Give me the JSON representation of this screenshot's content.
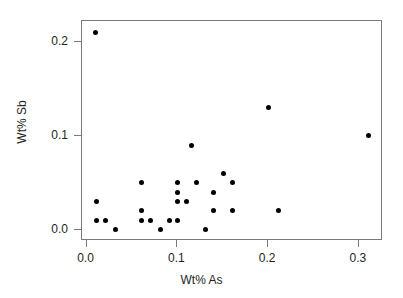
{
  "chart_data": {
    "type": "scatter",
    "title": "",
    "xlabel": "Wt% As",
    "ylabel": "Wt% Sb",
    "xlim": [
      -0.005,
      0.3265
    ],
    "ylim": [
      -0.012,
      0.2225
    ],
    "xticks": [
      "0.0",
      "0.1",
      "0.2",
      "0.3"
    ],
    "xtick_values": [
      0.0,
      0.1,
      0.2,
      0.3
    ],
    "yticks": [
      "0.0",
      "0.1",
      "0.2"
    ],
    "ytick_values": [
      0.0,
      0.1,
      0.2
    ],
    "grid": false,
    "legend": false,
    "marker": "filled-circle",
    "marker_color": "#000000",
    "frame_color": "#7a7a7a",
    "background": "#ffffff",
    "n_points": 30,
    "x": [
      0.01,
      0.01,
      0.01,
      0.02,
      0.03,
      0.06,
      0.06,
      0.06,
      0.07,
      0.08,
      0.09,
      0.1,
      0.1,
      0.1,
      0.1,
      0.11,
      0.11,
      0.12,
      0.12,
      0.14,
      0.14,
      0.15,
      0.15,
      0.16,
      0.16,
      0.2,
      0.21,
      0.31
    ],
    "y": [
      0.21,
      0.03,
      0.01,
      0.01,
      0.0,
      0.05,
      0.02,
      0.01,
      0.01,
      0.0,
      0.01,
      0.05,
      0.04,
      0.03,
      0.01,
      0.03,
      0.09,
      0.05,
      0.0,
      0.04,
      0.02,
      0.06,
      0.05,
      0.05,
      0.02,
      0.13,
      0.02,
      0.1
    ],
    "points": [
      {
        "x": 0.01,
        "y": 0.21
      },
      {
        "x": 0.011,
        "y": 0.03
      },
      {
        "x": 0.011,
        "y": 0.01
      },
      {
        "x": 0.021,
        "y": 0.01
      },
      {
        "x": 0.032,
        "y": 0.0
      },
      {
        "x": 0.06,
        "y": 0.05
      },
      {
        "x": 0.06,
        "y": 0.02
      },
      {
        "x": 0.06,
        "y": 0.01
      },
      {
        "x": 0.07,
        "y": 0.01
      },
      {
        "x": 0.081,
        "y": 0.0
      },
      {
        "x": 0.091,
        "y": 0.01
      },
      {
        "x": 0.1,
        "y": 0.05
      },
      {
        "x": 0.1,
        "y": 0.04
      },
      {
        "x": 0.1,
        "y": 0.03
      },
      {
        "x": 0.1,
        "y": 0.01
      },
      {
        "x": 0.11,
        "y": 0.03
      },
      {
        "x": 0.116,
        "y": 0.09
      },
      {
        "x": 0.121,
        "y": 0.05
      },
      {
        "x": 0.131,
        "y": 0.0
      },
      {
        "x": 0.14,
        "y": 0.04
      },
      {
        "x": 0.14,
        "y": 0.02
      },
      {
        "x": 0.151,
        "y": 0.06
      },
      {
        "x": 0.161,
        "y": 0.05
      },
      {
        "x": 0.161,
        "y": 0.02
      },
      {
        "x": 0.2,
        "y": 0.13
      },
      {
        "x": 0.211,
        "y": 0.02
      },
      {
        "x": 0.31,
        "y": 0.1
      }
    ]
  }
}
